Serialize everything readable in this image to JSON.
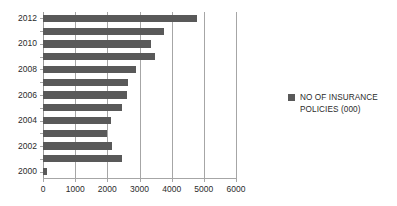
{
  "chart_data": {
    "type": "bar",
    "orientation": "horizontal",
    "title": "",
    "subtitle": "",
    "xlabel": "",
    "ylabel": "",
    "categories": [
      "2000",
      "2001",
      "2002",
      "2003",
      "2004",
      "2005",
      "2006",
      "2007",
      "2008",
      "2009",
      "2010",
      "2011",
      "2012"
    ],
    "series": [
      {
        "name": "NO OF INSURANCE POLICIES (000)",
        "color": "#595959",
        "values": [
          130,
          2450,
          2150,
          2000,
          2120,
          2450,
          2600,
          2650,
          2900,
          3480,
          3350,
          3750,
          4800
        ]
      }
    ],
    "xlim": [
      0,
      6000
    ],
    "xticks": [
      0,
      1000,
      2000,
      3000,
      4000,
      5000,
      6000
    ],
    "xtick_labels": [
      "0",
      "1000",
      "2000",
      "3000",
      "4000",
      "5000",
      "6000"
    ],
    "ytick_labels": [
      "2012",
      "2010",
      "2008",
      "2006",
      "2004",
      "2002",
      "2000"
    ],
    "grid": true,
    "grid_axis": "x",
    "legend_position": "right",
    "legend": [
      {
        "label_line_1": "NO OF INSURANCE",
        "label_line_2": "POLICIES (000)",
        "marker": "square-marker",
        "color": "#595959"
      }
    ],
    "colors": {
      "bar": "#595959",
      "grid": "#a6a6a6",
      "axis": "#a6a6a6",
      "text": "#2b2b2b",
      "background": "#ffffff"
    }
  }
}
